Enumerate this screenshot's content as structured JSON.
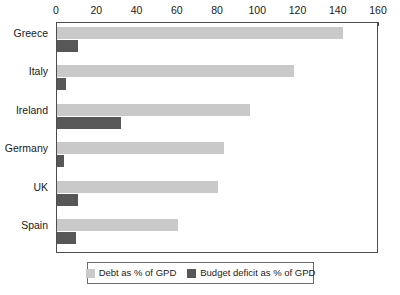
{
  "chart_data": {
    "type": "bar",
    "orientation": "horizontal",
    "title": "",
    "subtitle": "",
    "xlabel": "",
    "ylabel": "",
    "xlim": [
      0,
      160
    ],
    "ylim": null,
    "grid": false,
    "legend_position": "bottom",
    "xticks": [
      0,
      20,
      40,
      60,
      80,
      100,
      120,
      140,
      160
    ],
    "xtick_labels": [
      "0",
      "20",
      "40",
      "60",
      "80",
      "100",
      "120",
      "140",
      "160"
    ],
    "categories": [
      "Greece",
      "Italy",
      "Ireland",
      "Germany",
      "UK",
      "Spain"
    ],
    "series": [
      {
        "name": "Debt as % of GPD",
        "color": "#c9c9c9",
        "values": [
          142,
          118,
          96,
          83,
          80,
          60
        ]
      },
      {
        "name": "Budget deficit as % of GPD",
        "color": "#575757",
        "values": [
          10.5,
          4.5,
          32,
          3.3,
          10.5,
          9.2
        ]
      }
    ]
  },
  "legend": {
    "entries": [
      {
        "label": "Debt as % of GPD"
      },
      {
        "label": "Budget deficit as % of GPD"
      }
    ]
  }
}
